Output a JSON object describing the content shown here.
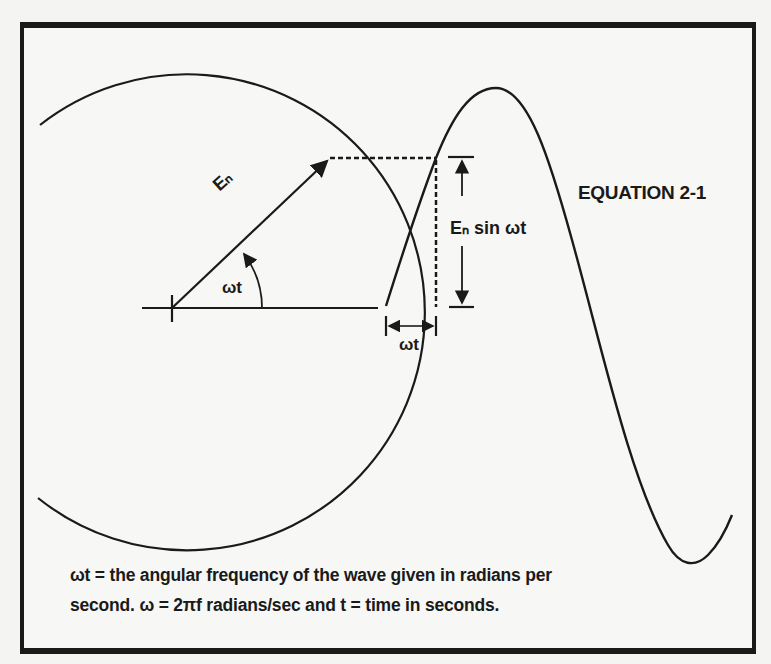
{
  "figure": {
    "equation_label": "EQUATION 2-1",
    "labels": {
      "phasor": "Eₙ",
      "angle": "ωt",
      "amplitude": "Eₙ sin ωt",
      "horizontal": "ωt"
    },
    "caption": {
      "line1": "ωt = the angular frequency of the wave given in radians per",
      "line2": "second. ω = 2πf radians/sec and t = time in seconds."
    },
    "colors": {
      "ink": "#1a1a1a",
      "paper": "#f7f7f5"
    }
  }
}
